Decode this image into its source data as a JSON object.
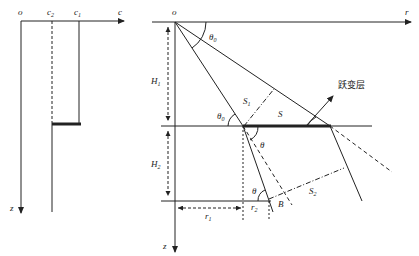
{
  "left_panel": {
    "origin": "o",
    "x_axis_label": "c",
    "z_axis_label": "z",
    "c2_label": "c",
    "c2_sub": "2",
    "c1_label": "c",
    "c1_sub": "1"
  },
  "right_panel": {
    "origin": "o",
    "r_axis_label": "r",
    "z_axis_label": "z",
    "H1_label": "H",
    "H1_sub": "1",
    "H2_label": "H",
    "H2_sub": "2",
    "theta0_top": "θ",
    "theta0_top_sub": "0",
    "theta0_mid": "θ",
    "theta0_mid_sub": "0",
    "theta_mid": "θ",
    "theta_bottom": "θ",
    "S1_label": "S",
    "S1_sub": "1",
    "S_label": "S",
    "S2_label": "S",
    "S2_sub": "2",
    "B_label": "B",
    "r1_label": "r",
    "r1_sub": "1",
    "r2_label": "r",
    "r2_sub": "2",
    "transition_layer": "跃变层"
  },
  "colors": {
    "line": "#222222",
    "background": "#ffffff"
  }
}
